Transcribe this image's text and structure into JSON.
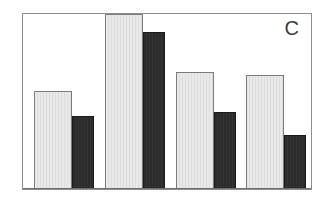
{
  "figure": {
    "panel_label": "C",
    "background_color": "#ffffff",
    "frame_color": "#8d8d8d"
  },
  "chart_data": {
    "type": "bar",
    "title": "C",
    "xlabel": "",
    "ylabel": "",
    "categories": [
      "1",
      "2",
      "3",
      "4"
    ],
    "grid": false,
    "legend_position": "none",
    "axis_ticks_visible": false,
    "ylim": [
      0,
      100
    ],
    "series": [
      {
        "name": "light",
        "color": "#e9e9e9",
        "edge_color": "#7b7b7b",
        "values": [
          56,
          100,
          67,
          65
        ]
      },
      {
        "name": "dark",
        "color": "#2b2b2b",
        "edge_color": "#1a1a1a",
        "values": [
          42,
          90,
          44,
          31
        ]
      }
    ]
  },
  "bars": [
    {
      "name": "group-1-light",
      "series": "light",
      "left_pct": 3.8,
      "width_pct": 13.1,
      "height_pct": 56
    },
    {
      "name": "group-1-dark",
      "series": "dark",
      "left_pct": 16.9,
      "width_pct": 7.6,
      "height_pct": 42
    },
    {
      "name": "group-2-light",
      "series": "light",
      "left_pct": 28.6,
      "width_pct": 13.1,
      "height_pct": 100
    },
    {
      "name": "group-2-dark",
      "series": "dark",
      "left_pct": 41.7,
      "width_pct": 7.6,
      "height_pct": 90
    },
    {
      "name": "group-3-light",
      "series": "light",
      "left_pct": 53.1,
      "width_pct": 13.1,
      "height_pct": 67
    },
    {
      "name": "group-3-dark",
      "series": "dark",
      "left_pct": 66.2,
      "width_pct": 7.6,
      "height_pct": 44
    },
    {
      "name": "group-4-light",
      "series": "light",
      "left_pct": 77.6,
      "width_pct": 13.1,
      "height_pct": 65
    },
    {
      "name": "group-4-dark",
      "series": "dark",
      "left_pct": 90.7,
      "width_pct": 7.6,
      "height_pct": 31
    }
  ]
}
